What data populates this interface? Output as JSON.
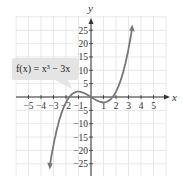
{
  "chart_data": {
    "type": "line",
    "title": "",
    "function_label": "f(x) = x³ − 3x",
    "xlabel": "x",
    "ylabel": "y",
    "xlim": [
      -6,
      6
    ],
    "ylim": [
      -30,
      30
    ],
    "x_ticks": [
      -5,
      -4,
      -3,
      -2,
      -1,
      1,
      2,
      3,
      4,
      5
    ],
    "y_ticks": [
      -25,
      -20,
      -15,
      -10,
      -5,
      5,
      10,
      15,
      20,
      25
    ],
    "x_tick_labels": [
      "−5",
      "−4",
      "−3",
      "−2",
      "−1",
      "1",
      "2",
      "3",
      "4",
      "5"
    ],
    "y_tick_labels": [
      "−25",
      "−20",
      "−15",
      "−10",
      "−5",
      "5",
      "10",
      "15",
      "20",
      "25"
    ],
    "grid": true,
    "series": [
      {
        "name": "f(x) = x³ − 3x",
        "x": [
          -3.3,
          -3,
          -2.5,
          -2,
          -1.5,
          -1,
          -0.5,
          0,
          0.5,
          1,
          1.5,
          2,
          2.5,
          3,
          3.3
        ],
        "values": [
          -26.0,
          -18,
          -8.1,
          -2,
          1.1,
          2,
          1.4,
          0,
          -1.4,
          -2,
          -1.1,
          2,
          8.1,
          18,
          26.0
        ]
      }
    ],
    "line_color": "#777777"
  },
  "labels": {
    "x_axis": "x",
    "y_axis": "y",
    "callout": "f(x) = x³ − 3x"
  }
}
